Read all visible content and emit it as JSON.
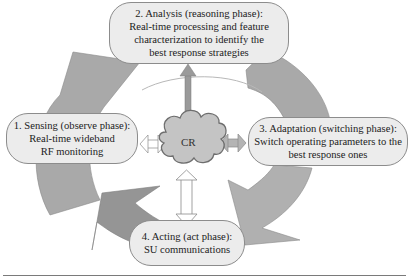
{
  "diagram": {
    "center": {
      "label": "CR"
    },
    "phases": [
      {
        "id": 1,
        "lines": [
          "1. Sensing (observe phase):",
          "Real-time wideband",
          "RF monitoring"
        ]
      },
      {
        "id": 2,
        "lines": [
          "2. Analysis (reasoning phase):",
          "Real-time processing and feature",
          "characterization to identify the",
          "best response strategies"
        ]
      },
      {
        "id": 3,
        "lines": [
          "3. Adaptation (switching phase):",
          "Switch operating parameters to the",
          "best response ones"
        ]
      },
      {
        "id": 4,
        "lines": [
          "4. Acting (act phase):",
          "SU communications"
        ]
      }
    ],
    "colors": {
      "cycle_arrow": "#a9a9a9",
      "cycle_arrow_dark": "#959595",
      "box_fill": "#ececec",
      "box_border": "#8c8c8c",
      "cloud_fill": "#c4c4c4",
      "cloud_border": "#6e6e6e",
      "link_arrow_analysis": "#9a9a9a",
      "divider": "#7a7a7a"
    }
  }
}
